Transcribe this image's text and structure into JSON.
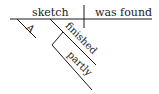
{
  "diagram": {
    "type": "sentence-diagram",
    "subject": "sketch",
    "predicate": "was found",
    "subject_modifiers": [
      {
        "word": "A"
      },
      {
        "word": "finished",
        "modifier": {
          "word": "partly"
        }
      }
    ],
    "colors": {
      "ink": "#1a1a1a",
      "background": "#ffffff"
    }
  }
}
